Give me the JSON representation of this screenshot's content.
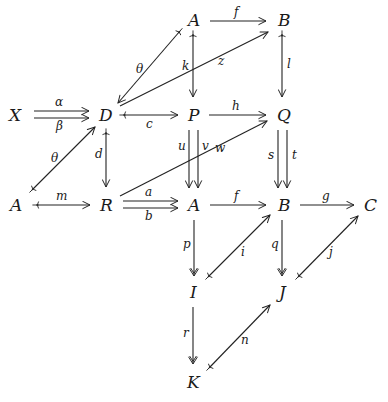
{
  "diagram": {
    "title": "",
    "nodes": [
      {
        "id": "A_top",
        "label": "A",
        "x": 194,
        "y": 21
      },
      {
        "id": "B_top",
        "label": "B",
        "x": 284,
        "y": 21
      },
      {
        "id": "X",
        "label": "X",
        "x": 17,
        "y": 115
      },
      {
        "id": "D",
        "label": "D",
        "x": 106,
        "y": 115
      },
      {
        "id": "P",
        "label": "P",
        "x": 194,
        "y": 115
      },
      {
        "id": "Q",
        "label": "Q",
        "x": 284,
        "y": 115
      },
      {
        "id": "A_left",
        "label": "A",
        "x": 17,
        "y": 205
      },
      {
        "id": "R",
        "label": "R",
        "x": 106,
        "y": 205
      },
      {
        "id": "A_mid",
        "label": "A",
        "x": 194,
        "y": 205
      },
      {
        "id": "B_mid",
        "label": "B",
        "x": 284,
        "y": 205
      },
      {
        "id": "C",
        "label": "C",
        "x": 370,
        "y": 205
      },
      {
        "id": "I",
        "label": "I",
        "x": 194,
        "y": 292
      },
      {
        "id": "J",
        "label": "J",
        "x": 284,
        "y": 292
      },
      {
        "id": "K",
        "label": "K",
        "x": 194,
        "y": 382
      }
    ],
    "edges": [
      {
        "name": "f",
        "from": "A_top",
        "to": "B_top",
        "type": "arrow"
      },
      {
        "name": "theta",
        "label": "θ",
        "from": "A_top",
        "to": "D",
        "type": "mono"
      },
      {
        "name": "k",
        "from": "A_top",
        "to": "P",
        "type": "mono"
      },
      {
        "name": "z",
        "from": "D",
        "to": "B_top",
        "type": "arrow"
      },
      {
        "name": "l",
        "from": "B_top",
        "to": "Q",
        "type": "mono"
      },
      {
        "name": "alpha",
        "label": "α",
        "from": "X",
        "to": "D",
        "type": "arrow"
      },
      {
        "name": "beta",
        "label": "β",
        "from": "X",
        "to": "D",
        "type": "arrow"
      },
      {
        "name": "c",
        "from": "D",
        "to": "P",
        "type": "mono"
      },
      {
        "name": "h",
        "from": "P",
        "to": "Q",
        "type": "arrow"
      },
      {
        "name": "d",
        "from": "D",
        "to": "R",
        "type": "mono"
      },
      {
        "name": "theta2",
        "label": "θ",
        "from": "A_left",
        "to": "D",
        "type": "mono"
      },
      {
        "name": "u",
        "from": "P",
        "to": "A_mid",
        "type": "arrow"
      },
      {
        "name": "v",
        "from": "P",
        "to": "A_mid",
        "type": "arrow"
      },
      {
        "name": "w",
        "from": "R",
        "to": "Q",
        "type": "arrow"
      },
      {
        "name": "s",
        "from": "Q",
        "to": "B_mid",
        "type": "arrow"
      },
      {
        "name": "t",
        "from": "Q",
        "to": "B_mid",
        "type": "arrow"
      },
      {
        "name": "m",
        "from": "A_left",
        "to": "R",
        "type": "mono"
      },
      {
        "name": "a",
        "from": "R",
        "to": "A_mid",
        "type": "arrow"
      },
      {
        "name": "b",
        "from": "R",
        "to": "A_mid",
        "type": "arrow"
      },
      {
        "name": "f2",
        "label": "f",
        "from": "A_mid",
        "to": "B_mid",
        "type": "arrow"
      },
      {
        "name": "g",
        "from": "B_mid",
        "to": "C",
        "type": "arrow"
      },
      {
        "name": "p",
        "from": "A_mid",
        "to": "I",
        "type": "epi"
      },
      {
        "name": "i",
        "from": "I",
        "to": "B_mid",
        "type": "mono"
      },
      {
        "name": "q",
        "from": "B_mid",
        "to": "J",
        "type": "epi"
      },
      {
        "name": "j",
        "from": "J",
        "to": "C",
        "type": "mono"
      },
      {
        "name": "r",
        "from": "I",
        "to": "K",
        "type": "epi"
      },
      {
        "name": "n",
        "from": "K",
        "to": "J",
        "type": "mono"
      }
    ],
    "labels": {
      "A_top": "A",
      "B_top": "B",
      "X": "X",
      "D": "D",
      "P": "P",
      "Q": "Q",
      "A_left": "A",
      "R": "R",
      "A_mid": "A",
      "B_mid": "B",
      "C": "C",
      "I": "I",
      "J": "J",
      "K": "K",
      "f": "f",
      "theta": "θ",
      "k": "k",
      "z": "z",
      "l": "l",
      "alpha": "α",
      "beta": "β",
      "c": "c",
      "h": "h",
      "d": "d",
      "theta2": "θ",
      "u": "u",
      "v": "v",
      "w": "w",
      "s": "s",
      "t": "t",
      "m": "m",
      "a": "a",
      "b": "b",
      "f2": "f",
      "g": "g",
      "p": "p",
      "i": "i",
      "q": "q",
      "j": "j",
      "r": "r",
      "n": "n"
    }
  }
}
